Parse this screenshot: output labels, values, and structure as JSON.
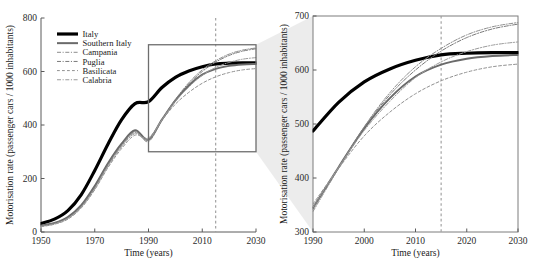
{
  "figure": {
    "background": "#ffffff",
    "accent_dashed_color": "#9a9a9a",
    "zoombox_color": "#6e6e6e"
  },
  "legend": {
    "position": "top-left-of-left-panel",
    "entries": [
      {
        "label": "Italy",
        "color": "#000000",
        "style": "solid",
        "width": 3.2
      },
      {
        "label": "Southern Italy",
        "color": "#6a6a6a",
        "style": "solid",
        "width": 2.0
      },
      {
        "label": "Campania",
        "color": "#8c8c8c",
        "style": "dashdot",
        "width": 1.0
      },
      {
        "label": "Puglia",
        "color": "#7a7a7a",
        "style": "dashdot",
        "width": 1.0
      },
      {
        "label": "Basilicata",
        "color": "#909090",
        "style": "dashed",
        "width": 1.0
      },
      {
        "label": "Calabria",
        "color": "#9a9a9a",
        "style": "dashdot",
        "width": 1.0
      }
    ]
  },
  "chart_data": [
    {
      "id": "left-panel",
      "type": "line",
      "title": "",
      "xlabel": "Time (years)",
      "ylabel": "Motorisation rate (passenger cars / 1000 inhabitants)",
      "xlim": [
        1950,
        2030
      ],
      "ylim": [
        0,
        800
      ],
      "xticks": [
        1950,
        1970,
        1990,
        2010,
        2030
      ],
      "yticks": [
        0,
        200,
        400,
        600,
        800
      ],
      "grid": false,
      "legend_position": "upper left",
      "annotations": [
        {
          "name": "forecast-line",
          "type": "vline",
          "x": 2015,
          "style": "dashed"
        },
        {
          "name": "zoom-box",
          "type": "rect",
          "x0": 1990,
          "x1": 2030,
          "y0": 300,
          "y1": 700
        }
      ],
      "x": [
        1950,
        1955,
        1960,
        1965,
        1970,
        1975,
        1980,
        1985,
        1990,
        1995,
        2000,
        2005,
        2010,
        2015,
        2020,
        2025,
        2030
      ],
      "series": [
        {
          "name": "Italy",
          "values": [
            32,
            48,
            80,
            140,
            230,
            330,
            420,
            480,
            487,
            540,
            578,
            602,
            618,
            628,
            631,
            632,
            632
          ]
        },
        {
          "name": "Southern Italy",
          "values": [
            24,
            34,
            56,
            100,
            172,
            258,
            330,
            380,
            345,
            420,
            492,
            548,
            588,
            610,
            621,
            626,
            628
          ]
        },
        {
          "name": "Campania",
          "values": [
            22,
            32,
            52,
            95,
            165,
            250,
            322,
            372,
            338,
            418,
            495,
            558,
            606,
            640,
            665,
            680,
            688
          ]
        },
        {
          "name": "Puglia",
          "values": [
            23,
            33,
            54,
            98,
            168,
            254,
            326,
            376,
            342,
            420,
            494,
            554,
            600,
            635,
            660,
            676,
            685
          ]
        },
        {
          "name": "Basilicata",
          "values": [
            20,
            29,
            48,
            90,
            158,
            242,
            312,
            362,
            352,
            418,
            478,
            522,
            556,
            580,
            596,
            606,
            611
          ]
        },
        {
          "name": "Calabria",
          "values": [
            21,
            30,
            50,
            92,
            160,
            246,
            318,
            368,
            346,
            420,
            488,
            542,
            586,
            615,
            634,
            646,
            652
          ]
        }
      ]
    },
    {
      "id": "right-panel",
      "type": "line",
      "title": "",
      "xlabel": "Time (years)",
      "ylabel": "Motorisation rate (passenger cars / 1000 inhabitants)",
      "xlim": [
        1990,
        2030
      ],
      "ylim": [
        300,
        700
      ],
      "xticks": [
        1990,
        2000,
        2010,
        2020,
        2030
      ],
      "yticks": [
        300,
        400,
        500,
        600,
        700
      ],
      "grid": false,
      "legend_position": "none",
      "annotations": [
        {
          "name": "forecast-line",
          "type": "vline",
          "x": 2015,
          "style": "dashed"
        }
      ],
      "x": [
        1990,
        1995,
        2000,
        2005,
        2010,
        2015,
        2020,
        2025,
        2030
      ],
      "series": [
        {
          "name": "Italy",
          "values": [
            487,
            540,
            578,
            602,
            618,
            628,
            631,
            632,
            632
          ]
        },
        {
          "name": "Southern Italy",
          "values": [
            345,
            420,
            492,
            548,
            588,
            610,
            621,
            626,
            628
          ]
        },
        {
          "name": "Campania",
          "values": [
            338,
            418,
            495,
            558,
            606,
            640,
            665,
            680,
            688
          ]
        },
        {
          "name": "Puglia",
          "values": [
            342,
            420,
            494,
            554,
            600,
            635,
            660,
            676,
            685
          ]
        },
        {
          "name": "Basilicata",
          "values": [
            352,
            418,
            478,
            522,
            556,
            580,
            596,
            606,
            611
          ]
        },
        {
          "name": "Calabria",
          "values": [
            346,
            420,
            488,
            542,
            586,
            615,
            634,
            646,
            652
          ]
        }
      ]
    }
  ]
}
